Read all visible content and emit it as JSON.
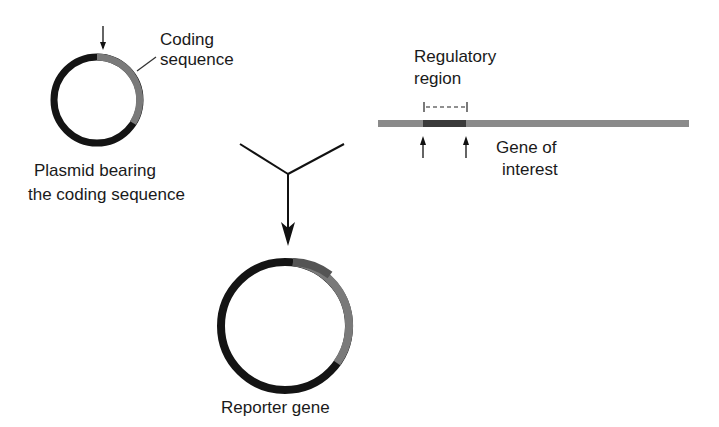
{
  "labels": {
    "coding_sequence": [
      "Coding",
      "sequence"
    ],
    "plasmid": [
      "Plasmid bearing",
      "the coding sequence"
    ],
    "regulatory_region": [
      "Regulatory",
      "region"
    ],
    "gene_of_interest": [
      "Gene of",
      "interest"
    ],
    "reporter_gene": "Reporter gene"
  },
  "colors": {
    "black_segment": "#141414",
    "coding_gray": "#7a7a7a",
    "regulatory_dark": "#3a3a3a",
    "gene_bar": "#8a8a8a"
  }
}
